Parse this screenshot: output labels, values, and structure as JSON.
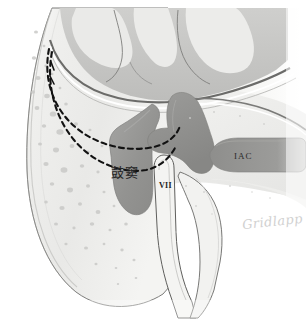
{
  "figure": {
    "width": 306,
    "height": 323,
    "background_color": "#ffffff"
  },
  "labels": {
    "antrum": "鼓窦",
    "facial_nerve": "VII",
    "internal_auditory_canal": "IAC"
  },
  "signature": {
    "artist": "Gridlapp"
  },
  "colors": {
    "background": "#ffffff",
    "bone_light": "#f0f0ee",
    "bone_mid": "#e2e2e0",
    "bone_shadow": "#cfcfcd",
    "air_cell": "#d2d2d0",
    "brain_gray_matter": "#c6c6c4",
    "brain_white_matter": "#e8e8e6",
    "antrum_fill": "#9a9a98",
    "vestibule_fill": "#8f8f8d",
    "iac_fill": "#9a9a98",
    "dura_line": "#6b6b69",
    "outline": "#5a5a58",
    "dashed_line": "#121212",
    "label_text": "#262626",
    "signature_text": "#c9c9c9"
  },
  "structures": [
    {
      "name": "mastoid-cortex",
      "description": "Outer mastoid bone cortex, left convex border"
    },
    {
      "name": "mastoid-air-cells",
      "description": "Stippled pneumatized air cells filling the mastoid"
    },
    {
      "name": "brain-parenchyma",
      "description": "Temporal lobe gyri above the tegmen"
    },
    {
      "name": "dural-plane",
      "description": "Tegmen / middle fossa dural line"
    },
    {
      "name": "mastoid-antrum",
      "description": "Mastoid antrum cavity, shaded dark gray"
    },
    {
      "name": "vestibule-semicircular-canal",
      "description": "Vestibule and lateral semicircular canal complex"
    },
    {
      "name": "internal-auditory-canal",
      "description": "IAC extending laterally to the right"
    },
    {
      "name": "facial-nerve-canal",
      "description": "Descending mastoid segment of the facial nerve (VII)"
    },
    {
      "name": "surgical-approach-dashed-upper",
      "description": "Upper dashed trajectory line"
    },
    {
      "name": "surgical-approach-dashed-lower",
      "description": "Lower dashed trajectory line"
    }
  ]
}
